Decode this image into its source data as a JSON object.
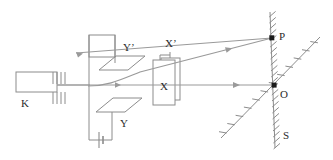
{
  "figure": {
    "stroke_color": "#8c8c8c",
    "beam_color": "#9a9a9a",
    "label_color": "#2b2b2b",
    "background": "#ffffff"
  },
  "labels": {
    "cathode": "K",
    "y_upper_plate": "Y’",
    "y_lower_plate": "Y",
    "x_front_plate": "X",
    "x_back_plate": "X’",
    "screen_point_deflected": "P",
    "screen_point_origin": "O",
    "screen": "S"
  },
  "components": {
    "cathode": {
      "name": "K",
      "shape": "rectangle"
    },
    "grid": {
      "name": "grid-electrodes",
      "bars_above": 4,
      "bars_below": 4
    },
    "vertical_deflection_plates": {
      "upper": "Y’",
      "lower": "Y",
      "shape": "parallelogram"
    },
    "horizontal_deflection_plates": {
      "front": "X",
      "back": "X’",
      "shape": "rectangle"
    },
    "power_supply": {
      "name": "battery-cell",
      "symbol": "cell"
    },
    "fluorescent_screen": {
      "name": "S",
      "orientation": "vertical-hatched"
    },
    "reference_plane": {
      "name": "diagonal-hatched-plane",
      "orientation": "diagonal"
    }
  },
  "beams": [
    {
      "name": "undeflected-beam",
      "from": "cathode",
      "to": "O",
      "arrowheads": 2
    },
    {
      "name": "deflected-beam",
      "from": "cathode",
      "to": "P",
      "arrowheads": 2
    }
  ]
}
